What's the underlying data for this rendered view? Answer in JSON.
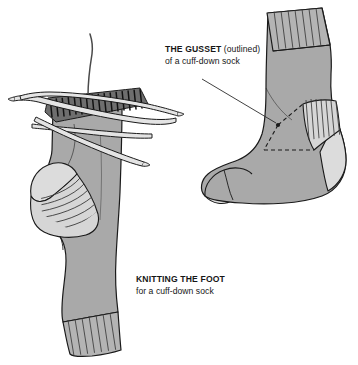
{
  "figure": {
    "name": "sock-knitting-diagram",
    "background_color": "#ffffff"
  },
  "labels": {
    "gusset": {
      "title_bold": "THE GUSSET",
      "title_regular": " (outlined)",
      "subtitle": "of a cuff-down sock"
    },
    "foot": {
      "title_bold": "KNITTING THE FOOT",
      "title_regular": "",
      "subtitle": "for a cuff-down sock"
    }
  },
  "colors": {
    "sock_body": "#a9a9a9",
    "sock_body_shadow": "#9a9a9a",
    "sock_light": "#dcdcdc",
    "sock_light_alt": "#d2d2d2",
    "needle_fill": "#e4e4e4",
    "stitch_dark": "#6e6e6e",
    "outline": "#1a1a1a",
    "text": "#161616",
    "leader_line": "#2b2b2b"
  },
  "diagrams": {
    "left": {
      "name": "knitting-the-foot-sock",
      "parts": [
        "sock-leg",
        "active-stitches",
        "knitting-needle-1",
        "knitting-needle-2",
        "knitting-needle-3",
        "working-yarn",
        "heel-turn",
        "heel-ribbing",
        "cuff-ribbing"
      ]
    },
    "right": {
      "name": "finished-cuff-down-sock",
      "parts": [
        "cuff-ribbing",
        "sock-leg",
        "heel-ribbing",
        "toe",
        "sole",
        "gusset-outline"
      ],
      "gusset_outline_style": "dashed-triangle"
    }
  }
}
